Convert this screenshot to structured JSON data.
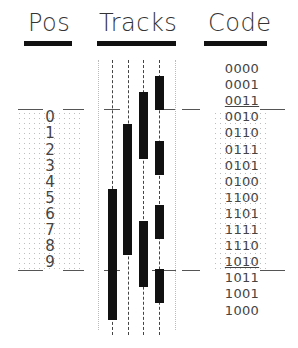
{
  "headers": {
    "pos": "Pos",
    "tracks": "Tracks",
    "code": "Code"
  },
  "positions": [
    "0",
    "1",
    "2",
    "3",
    "4",
    "5",
    "6",
    "7",
    "8",
    "9"
  ],
  "codes": [
    "0000",
    "0001",
    "0011",
    "0010",
    "0110",
    "0111",
    "0101",
    "0100",
    "1100",
    "1101",
    "1111",
    "1110",
    "1010",
    "1011",
    "1001",
    "1000"
  ],
  "tracks": [
    {
      "name": "track-1",
      "bit": 3,
      "segments": [
        [
          8,
          15
        ]
      ]
    },
    {
      "name": "track-2",
      "bit": 2,
      "segments": [
        [
          4,
          11
        ]
      ]
    },
    {
      "name": "track-3",
      "bit": 1,
      "segments": [
        [
          2,
          5
        ],
        [
          10,
          13
        ]
      ]
    },
    {
      "name": "track-4",
      "bit": 0,
      "segments": [
        [
          1,
          2
        ],
        [
          5,
          6
        ],
        [
          9,
          10
        ],
        [
          13,
          14
        ]
      ]
    }
  ],
  "range": {
    "start_row": 3,
    "end_row": 12
  },
  "colors": {
    "bar": "#111111",
    "text": "#444444",
    "dots": "#bdbdbd"
  }
}
